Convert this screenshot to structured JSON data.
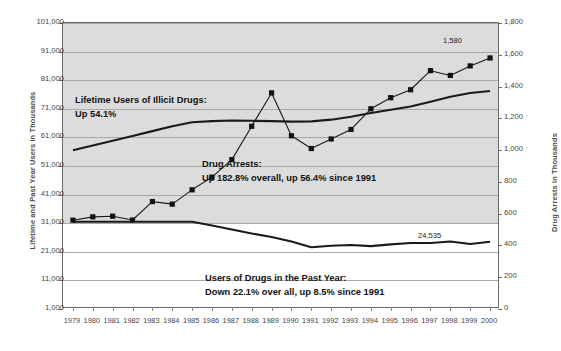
{
  "chart_data": {
    "type": "line",
    "title": "",
    "xlabel": "",
    "ylabel": "Lifetime and Past Year Users in Thousands",
    "y2label": "Drug Arrests in Thousands",
    "grid": true,
    "legend_position": "inline-annotations",
    "x": [
      1979,
      1980,
      1981,
      1982,
      1983,
      1984,
      1985,
      1986,
      1987,
      1988,
      1989,
      1990,
      1991,
      1992,
      1993,
      1994,
      1995,
      1996,
      1997,
      1998,
      1999,
      2000
    ],
    "xticklabels": [
      "1979",
      "1980",
      "1981",
      "1982",
      "1983",
      "1984",
      "1985",
      "1986",
      "1987",
      "1988",
      "1989",
      "1990",
      "1991",
      "1992",
      "1993",
      "1994",
      "1995",
      "1996",
      "1997",
      "1998",
      "1999",
      "2000"
    ],
    "ylim": [
      1000,
      101000
    ],
    "yticks": [
      1000,
      11000,
      21000,
      31000,
      41000,
      51000,
      61000,
      71000,
      81000,
      91000,
      101000
    ],
    "yticklabels": [
      "1,000",
      "11,000",
      "21,000",
      "31,000",
      "41,000",
      "51,000",
      "61,000",
      "71,000",
      "81,000",
      "91,000",
      "101,000"
    ],
    "y2lim": [
      0,
      1800
    ],
    "y2ticks": [
      0,
      200,
      400,
      600,
      800,
      1000,
      1200,
      1400,
      1600,
      1800
    ],
    "y2ticklabels": [
      "0",
      "200",
      "400",
      "600",
      "800",
      "1,000",
      "1,200",
      "1,400",
      "1,600",
      "1,800"
    ],
    "series": [
      {
        "name": "Lifetime Users of Illicit Drugs",
        "axis": "left",
        "marker": "none",
        "values": [
          56500,
          58200,
          59800,
          61500,
          63200,
          64900,
          66300,
          66700,
          66900,
          66800,
          66700,
          66500,
          66600,
          67200,
          68200,
          69500,
          70700,
          71800,
          73500,
          75200,
          76500,
          77200
        ]
      },
      {
        "name": "Users of Drugs in the Past Year",
        "axis": "left",
        "marker": "none",
        "values": [
          31500,
          31500,
          31500,
          31500,
          31500,
          31500,
          31500,
          30200,
          28800,
          27400,
          26200,
          24600,
          22600,
          23100,
          23400,
          23000,
          23600,
          24100,
          24100,
          24600,
          23700,
          24535
        ]
      },
      {
        "name": "Drug Arrests",
        "axis": "right",
        "marker": "square",
        "values": [
          559,
          580,
          584,
          560,
          676,
          660,
          750,
          830,
          940,
          1150,
          1360,
          1090,
          1010,
          1070,
          1130,
          1260,
          1330,
          1380,
          1500,
          1470,
          1530,
          1580
        ]
      }
    ],
    "annotations": [
      {
        "id": "lifetime",
        "line1": "Lifetime Users of Illicit Drugs:",
        "line2": "Up 54.1%"
      },
      {
        "id": "arrests",
        "line1": "Drug Arrests:",
        "line2": "Up 182.8% overall, up 56.4% since 1991"
      },
      {
        "id": "pastyear",
        "line1": "Users of Drugs in the Past Year:",
        "line2": "Down 22.1% over all, up 8.5% since 1991"
      }
    ],
    "data_labels": [
      {
        "id": "arrests-2000",
        "text": "1,580"
      },
      {
        "id": "pastyear-2000",
        "text": "24,535"
      }
    ],
    "colors": {
      "line": "#1a1a1a",
      "marker": "#111111",
      "gridline": "#a9a9a9",
      "plot_shade": "#dcdcdc",
      "plot_background": "#ffffff",
      "axis": "#6b6b6b",
      "text": "#444444"
    }
  }
}
